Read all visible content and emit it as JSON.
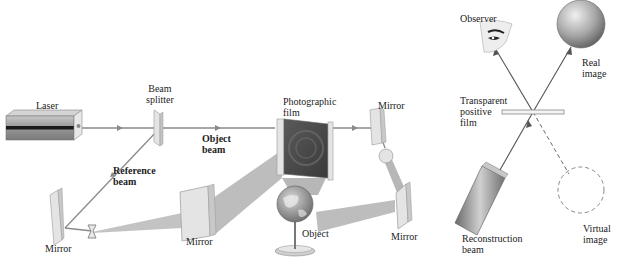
{
  "figure": {
    "left_panel": {
      "title": "Hologram recording setup",
      "labels": {
        "laser": "Laser",
        "beam_splitter_line1": "Beam",
        "beam_splitter_line2": "splitter",
        "object_beam_line1": "Object",
        "object_beam_line2": "beam",
        "reference_beam_line1": "Reference",
        "reference_beam_line2": "beam",
        "photographic_film_line1": "Photographic",
        "photographic_film_line2": "film",
        "mirror_top_right": "Mirror",
        "mirror_left": "Mirror",
        "mirror_center": "Mirror",
        "mirror_bottom_right": "Mirror",
        "object": "Object"
      }
    },
    "right_panel": {
      "title": "Hologram reconstruction",
      "labels": {
        "observer": "Observer",
        "real_image_line1": "Real",
        "real_image_line2": "image",
        "transparent_film_line1": "Transparent",
        "transparent_film_line2": "positive",
        "transparent_film_line3": "film",
        "reconstruction_beam_line1": "Reconstruction",
        "reconstruction_beam_line2": "beam",
        "virtual_image_line1": "Virtual",
        "virtual_image_line2": "image"
      }
    },
    "colors": {
      "beam": "#8a8a8a",
      "beam_light": "#b8b8b8",
      "mirror_face": "#e6e6e6",
      "mirror_edge": "#9a9a9a",
      "laser_body": "#9c9c9c",
      "laser_stripe": "#1a1a1a",
      "film_dark": "#555555"
    }
  }
}
